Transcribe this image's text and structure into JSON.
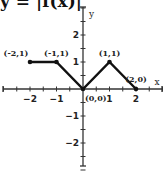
{
  "title": "y = |f(x)|",
  "chart_data": {
    "type": "line",
    "title": "y = |f(x)|",
    "xlabel": "x",
    "ylabel": "y",
    "xlim": [
      -3,
      3
    ],
    "ylim": [
      -3,
      3
    ],
    "x_ticks": [
      -2,
      -1,
      1,
      2
    ],
    "y_ticks": [
      2,
      1,
      -1,
      -2
    ],
    "grid": false,
    "series": [
      {
        "name": "y = |f(x)|",
        "x": [
          -2,
          -1,
          0,
          1,
          2
        ],
        "y": [
          1,
          1,
          0,
          1,
          0
        ]
      }
    ],
    "annotations": [
      "(-2,1)",
      "(-1,1)",
      "(0,0)",
      "(1,1)",
      "(2,0)"
    ]
  },
  "colors": {
    "line": "#111111",
    "axis": "#333333"
  }
}
